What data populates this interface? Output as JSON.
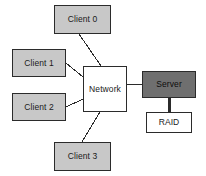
{
  "diagram": {
    "background_color": "#ffffff",
    "stroke_color": "#2b2b2b",
    "colors": {
      "client_fill": "#c8c8c8",
      "network_fill": "#ffffff",
      "server_fill": "#6f6f6f",
      "storage_fill": "#ffffff"
    },
    "nodes": [
      {
        "id": "client0",
        "label": "Client 0",
        "kind": "client",
        "x": 54,
        "y": 5,
        "w": 57,
        "h": 29
      },
      {
        "id": "client1",
        "label": "Client 1",
        "kind": "client",
        "x": 12,
        "y": 49,
        "w": 54,
        "h": 28
      },
      {
        "id": "client2",
        "label": "Client 2",
        "kind": "client",
        "x": 12,
        "y": 93,
        "w": 54,
        "h": 28
      },
      {
        "id": "client3",
        "label": "Client 3",
        "kind": "client",
        "x": 54,
        "y": 142,
        "w": 57,
        "h": 29
      },
      {
        "id": "network",
        "label": "Network",
        "kind": "network",
        "x": 83,
        "y": 66,
        "w": 44,
        "h": 46
      },
      {
        "id": "server",
        "label": "Server",
        "kind": "server",
        "x": 142,
        "y": 71,
        "w": 54,
        "h": 27
      },
      {
        "id": "raid",
        "label": "RAID",
        "kind": "storage",
        "x": 146,
        "y": 112,
        "w": 46,
        "h": 21
      }
    ],
    "edges": [
      {
        "id": "edge-client0-network",
        "from": "client0",
        "to": "network",
        "x1": 79,
        "y1": 34,
        "x2": 101,
        "y2": 66,
        "width": 1
      },
      {
        "id": "edge-client1-network",
        "from": "client1",
        "to": "network",
        "x1": 66,
        "y1": 63,
        "x2": 83,
        "y2": 77,
        "width": 1
      },
      {
        "id": "edge-client2-network",
        "from": "client2",
        "to": "network",
        "x1": 66,
        "y1": 107,
        "x2": 83,
        "y2": 99,
        "width": 1
      },
      {
        "id": "edge-client3-network",
        "from": "client3",
        "to": "network",
        "x1": 82,
        "y1": 142,
        "x2": 100,
        "y2": 112,
        "width": 1
      },
      {
        "id": "edge-network-server",
        "from": "network",
        "to": "server",
        "x1": 127,
        "y1": 84,
        "x2": 142,
        "y2": 84,
        "width": 1
      },
      {
        "id": "edge-server-raid",
        "from": "server",
        "to": "raid",
        "x1": 169,
        "y1": 98,
        "x2": 169,
        "y2": 112,
        "width": 3
      }
    ]
  }
}
